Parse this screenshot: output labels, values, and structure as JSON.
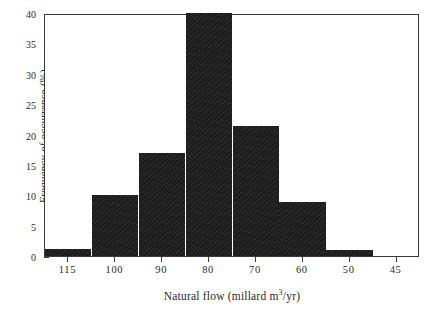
{
  "chart_data": {
    "type": "bar",
    "title": "",
    "xlabel": "Natural flow (millard m3/yr)",
    "xlabel_parts": {
      "before": "Natural flow (millard m",
      "sup": "3",
      "after": "/yr)"
    },
    "ylabel": "Frequency of occurrence (%)",
    "categories": [
      "115",
      "100",
      "90",
      "80",
      "70",
      "60",
      "50",
      "45"
    ],
    "values": [
      1.1,
      10.1,
      17.0,
      40.0,
      21.4,
      8.9,
      1.0,
      0
    ],
    "ylim": [
      0,
      40
    ],
    "yticks": [
      0,
      5,
      10,
      15,
      20,
      25,
      30,
      35,
      40
    ],
    "ytick_labels": [
      "0",
      "5",
      "10",
      "15",
      "20",
      "25",
      "30",
      "35",
      "40"
    ],
    "xtick_labels": [
      "115",
      "100",
      "90",
      "80",
      "70",
      "60",
      "50",
      "45"
    ],
    "grid": false,
    "legend": null,
    "bar_color": "#171717",
    "axis_color": "#3a3a3a",
    "background_color": "#ffffff"
  }
}
